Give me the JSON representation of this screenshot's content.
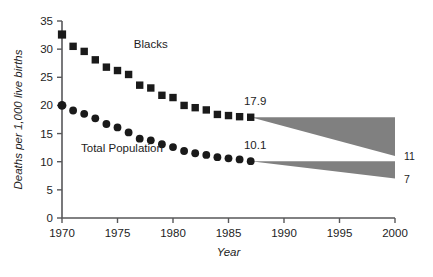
{
  "chart_data": {
    "type": "scatter",
    "title": "",
    "xlabel": "Year",
    "ylabel": "Deaths per 1,000 live births",
    "xlim": [
      1970,
      2000
    ],
    "ylim": [
      0,
      35
    ],
    "grid": false,
    "legend_position": "inline-annotation",
    "xticks": [
      "1970",
      "1975",
      "1980",
      "1985",
      "1990",
      "1995",
      "2000"
    ],
    "xtick_values": [
      1970,
      1975,
      1980,
      1985,
      1990,
      1995,
      2000
    ],
    "yticks": [
      "0",
      "5",
      "10",
      "15",
      "20",
      "25",
      "30",
      "35"
    ],
    "ytick_values": [
      0,
      5,
      10,
      15,
      20,
      25,
      30,
      35
    ],
    "x": [
      1970,
      1971,
      1972,
      1973,
      1974,
      1975,
      1976,
      1977,
      1978,
      1979,
      1980,
      1981,
      1982,
      1983,
      1984,
      1985,
      1986,
      1987
    ],
    "series": [
      {
        "name": "Blacks",
        "marker": "square",
        "color": "#1a1a1a",
        "values": [
          32.6,
          30.5,
          29.6,
          28.1,
          26.8,
          26.2,
          25.5,
          23.6,
          23.1,
          21.8,
          21.4,
          20.0,
          19.6,
          19.2,
          18.4,
          18.2,
          18.0,
          17.9
        ],
        "end_label": "17.9"
      },
      {
        "name": "Total Population",
        "marker": "circle",
        "color": "#1a1a1a",
        "values": [
          20.0,
          19.1,
          18.5,
          17.7,
          16.7,
          16.1,
          15.2,
          14.1,
          13.8,
          13.1,
          12.6,
          11.9,
          11.5,
          11.2,
          10.8,
          10.6,
          10.4,
          10.1
        ],
        "end_label": "10.1"
      }
    ],
    "projections": [
      {
        "name": "Blacks projection",
        "from_year": 1987,
        "from_value": 17.9,
        "to_year": 2000,
        "to_high": 17.9,
        "to_low": 11.0,
        "end_label": "11",
        "fill": "#808080"
      },
      {
        "name": "Total Population projection",
        "from_year": 1987,
        "from_value": 10.1,
        "to_year": 2000,
        "to_high": 10.1,
        "to_low": 7.0,
        "end_label": "7",
        "fill": "#808080"
      }
    ],
    "annotations": [
      {
        "text": "Blacks",
        "x": 1978.0,
        "y": 30.2
      },
      {
        "text": "Total Population",
        "x": 1975.4,
        "y": 11.7
      },
      {
        "text": "17.9",
        "x": 1987.4,
        "y": 20.1
      },
      {
        "text": "10.1",
        "x": 1987.4,
        "y": 12.3
      }
    ]
  },
  "axes": {
    "y_title": "Deaths per 1,000 live births",
    "x_title": "Year"
  }
}
